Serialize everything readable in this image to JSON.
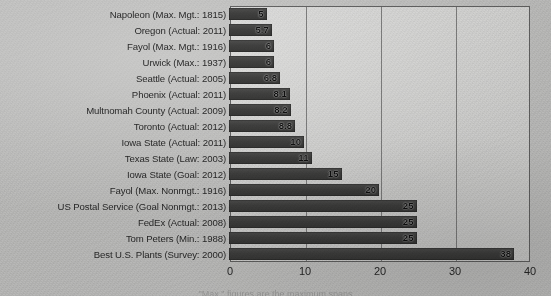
{
  "chart_data": {
    "type": "bar",
    "orientation": "horizontal",
    "title": "",
    "xlabel": "",
    "ylabel": "",
    "xlim": [
      0,
      40
    ],
    "xticks": [
      "0",
      "10",
      "20",
      "30",
      "40"
    ],
    "xtick_values": [
      0,
      10,
      20,
      30,
      40
    ],
    "grid": true,
    "legend": false,
    "bar_color": "#464645",
    "plot_bg_color": "#ededec",
    "page_bg_color": "#d7d7d6",
    "axis_color": "#6d6d6d",
    "categories": [
      "Napoleon (Max. Mgt.: 1815)",
      "Oregon (Actual: 2011)",
      "Fayol (Max. Mgt.: 1916)",
      "Urwick (Max.: 1937)",
      "Seattle (Actual: 2005)",
      "Phoenix (Actual: 2011)",
      "Multnomah County (Actual: 2009)",
      "Toronto (Actual: 2012)",
      "Iowa State (Actual: 2011)",
      "Texas State (Law: 2003)",
      "Iowa State (Goal: 2012)",
      "Fayol (Max. Nonmgt.: 1916)",
      "US Postal Service (Goal Nonmgt.: 2013)",
      "FedEx (Actual: 2008)",
      "Tom Peters (Min.: 1988)",
      "Best U.S. Plants (Survey: 2000)"
    ],
    "values": [
      5,
      5.7,
      6,
      6,
      6.8,
      8.1,
      8.2,
      8.8,
      10,
      11,
      15,
      20,
      25,
      25,
      25,
      38
    ],
    "value_labels": [
      "5",
      "5.7",
      "6",
      "6",
      "6.8",
      "8.1",
      "8.2",
      "8.8",
      "10",
      "11",
      "15",
      "20",
      "25",
      "25",
      "25",
      "38"
    ]
  },
  "bottom_caption": "\"Max.\" figures are the maximum spans"
}
